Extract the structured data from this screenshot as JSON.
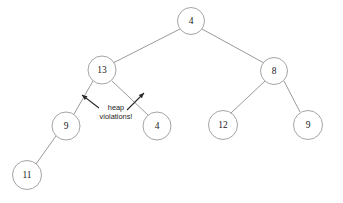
{
  "diagram": {
    "background_color": "#ffffff",
    "node_stroke_color": "#9a9a9a",
    "node_fill_color": "#ffffff",
    "edge_color": "#8e8e8e",
    "annotation_color": "#2b2b2b",
    "text_color": "#1a1a1a"
  },
  "nodes": [
    {
      "id": "root",
      "label": "4",
      "cx": 191,
      "cy": 21,
      "r": 13.5
    },
    {
      "id": "left",
      "label": "13",
      "cx": 102,
      "cy": 70,
      "r": 14.0
    },
    {
      "id": "right",
      "label": "8",
      "cx": 274,
      "cy": 71,
      "r": 13.5
    },
    {
      "id": "left-left",
      "label": "9",
      "cx": 66,
      "cy": 126,
      "r": 14.0
    },
    {
      "id": "left-right",
      "label": "4",
      "cx": 157,
      "cy": 126,
      "r": 14.0
    },
    {
      "id": "right-left",
      "label": "12",
      "cx": 223,
      "cy": 125,
      "r": 14.5
    },
    {
      "id": "right-right",
      "label": "9",
      "cx": 308,
      "cy": 125,
      "r": 14.5
    },
    {
      "id": "left-left-left",
      "label": "11",
      "cx": 27,
      "cy": 175,
      "r": 14.5
    }
  ],
  "edges": [
    {
      "id": "root-to-left",
      "from": "root",
      "to": "left",
      "x1": 180,
      "y1": 29,
      "x2": 113,
      "y2": 63
    },
    {
      "id": "root-to-right",
      "from": "root",
      "to": "right",
      "x1": 202,
      "y1": 29,
      "x2": 264,
      "y2": 63
    },
    {
      "id": "left-to-left-left",
      "from": "left",
      "to": "left-left",
      "x1": 93,
      "y1": 81,
      "x2": 74,
      "y2": 114
    },
    {
      "id": "left-to-left-right",
      "from": "left",
      "to": "left-right",
      "x1": 112,
      "y1": 81,
      "x2": 148,
      "y2": 115
    },
    {
      "id": "right-to-right-left",
      "from": "right",
      "to": "right-left",
      "x1": 265,
      "y1": 81,
      "x2": 231,
      "y2": 113
    },
    {
      "id": "right-to-right-right",
      "from": "right",
      "to": "right-right",
      "x1": 284,
      "y1": 81,
      "x2": 300,
      "y2": 112
    },
    {
      "id": "left-left-to-child",
      "from": "left-left",
      "to": "left-left-left",
      "x1": 56,
      "y1": 136,
      "x2": 36,
      "y2": 164
    }
  ],
  "annotation": {
    "id": "heap-violations-callout",
    "line1": "heap",
    "line2": "violations!",
    "text_x": 116,
    "line1_y": 110,
    "line2_y": 119,
    "arrows": [
      {
        "id": "arrow-to-left-edge",
        "x1": 99,
        "y1": 108,
        "x2": 82,
        "y2": 95,
        "head_angle_deg": 217
      },
      {
        "id": "arrow-to-right-edge",
        "x1": 127,
        "y1": 110,
        "x2": 144,
        "y2": 93,
        "head_angle_deg": 315
      }
    ]
  }
}
